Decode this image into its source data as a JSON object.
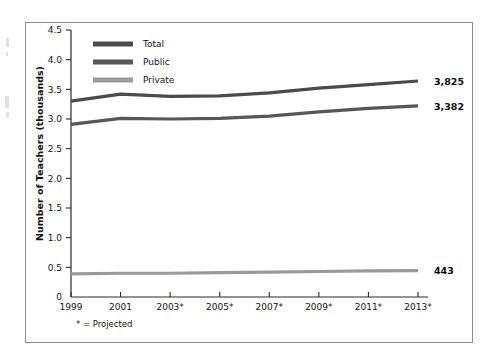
{
  "figure": {
    "frame_border_color": "#8d8d8d",
    "background": "#ffffff",
    "footnote": "* = Projected"
  },
  "chart_data": {
    "type": "line",
    "title": "",
    "xlabel": "",
    "ylabel": "Number of Teachers (thousands)",
    "categories": [
      "1999",
      "2001",
      "2003*",
      "2005*",
      "2007*",
      "2009*",
      "2011*",
      "2013*"
    ],
    "x_tick_labels": [
      "1999",
      "2001",
      "2003*",
      "2005*",
      "2007*",
      "2009*",
      "2011*",
      "2013*"
    ],
    "y_tick_labels": [
      "0",
      "0.5",
      "1.0",
      "1.5",
      "2.0",
      "2.5",
      "3.0",
      "3.5",
      "4.0",
      "4.5"
    ],
    "y_tick_values": [
      0,
      0.5,
      1.0,
      1.5,
      2.0,
      2.5,
      3.0,
      3.5,
      4.0,
      4.5
    ],
    "ylim": [
      0,
      4.5
    ],
    "grid": false,
    "legend_position": "upper-left-inside",
    "series": [
      {
        "name": "Total",
        "color": "#4b4b4b",
        "values": [
          3.3,
          3.42,
          3.38,
          3.39,
          3.44,
          3.52,
          3.58,
          3.64
        ],
        "end_label": "3,825"
      },
      {
        "name": "Public",
        "color": "#575757",
        "values": [
          2.91,
          3.01,
          3.0,
          3.01,
          3.05,
          3.12,
          3.18,
          3.22
        ],
        "end_label": "3,382"
      },
      {
        "name": "Private",
        "color": "#9a9a9a",
        "values": [
          0.39,
          0.4,
          0.4,
          0.41,
          0.42,
          0.43,
          0.44,
          0.445
        ],
        "end_label": "443"
      }
    ],
    "annotations": [
      "3,825",
      "3,382",
      "443"
    ]
  }
}
